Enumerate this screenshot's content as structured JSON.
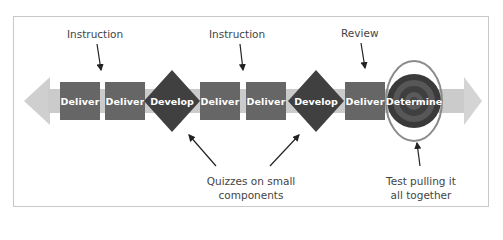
{
  "diagram": {
    "steps": [
      {
        "type": "deliver",
        "label": "Deliver"
      },
      {
        "type": "deliver",
        "label": "Deliver"
      },
      {
        "type": "develop",
        "label": "Develop"
      },
      {
        "type": "deliver",
        "label": "Deliver"
      },
      {
        "type": "deliver",
        "label": "Deliver"
      },
      {
        "type": "develop",
        "label": "Develop"
      },
      {
        "type": "deliver",
        "label": "Deliver"
      },
      {
        "type": "determine",
        "label": "Determine"
      }
    ],
    "annotations": {
      "instruction_1": "Instruction",
      "instruction_2": "Instruction",
      "review": "Review",
      "quizzes_line1": "Quizzes on small",
      "quizzes_line2": "components",
      "test_line1": "Test pulling it",
      "test_line2": "all together"
    },
    "colors": {
      "band": "#c8c8c8",
      "deliver": "#666666",
      "develop": "#404040",
      "target_outer": "#3a3a3a",
      "target_ring": "#5a5a5a",
      "ellipse": "#8a8a8a",
      "text": "#444444"
    }
  }
}
